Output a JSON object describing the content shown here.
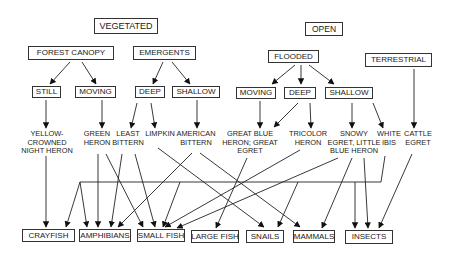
{
  "diagram": {
    "habitats": {
      "vegetated": "VEGETATED",
      "open": "OPEN",
      "forest_canopy": "FOREST CANOPY",
      "emergents": "EMERGENTS",
      "flooded": "FLOODED",
      "terrestrial": "TERRESTRIAL",
      "veg_still": "STILL",
      "veg_moving": "MOVING",
      "veg_deep": "DEEP",
      "veg_shallow": "SHALLOW",
      "open_moving": "MOVING",
      "open_deep": "DEEP",
      "open_shallow": "SHALLOW"
    },
    "birds": {
      "yellow_crowned_night_heron": "YELLOW-\nCROWNED\nNIGHT HERON",
      "green_heron": "GREEN\nHERON",
      "least_bittern": "LEAST\nBITTERN",
      "limpkin": "LIMPKIN",
      "american_bittern": "AMERICAN\nBITTERN",
      "great_blue_heron_great_egret": "GREAT BLUE\nHERON; GREAT\nEGRET",
      "tricolor_heron": "TRICOLOR\nHERON",
      "snowy_egret_little_blue_heron": "SNOWY\nEGRET, LITTLE\nBLUE HERON",
      "white_ibis": "WHITE\nIBIS",
      "cattle_egret": "CATTLE\nEGRET"
    },
    "prey": {
      "crayfish": "CRAYFISH",
      "amphibians": "AMPHIBIANS",
      "small_fish": "SMALL FISH",
      "large_fish": "LARGE FISH",
      "snails": "SNAILS",
      "mammals": "MAMMALS",
      "insects": "INSECTS"
    },
    "edges": [
      [
        "vegetated-habitat",
        "forest-canopy"
      ],
      [
        "vegetated-habitat",
        "emergents"
      ],
      [
        "forest-canopy",
        "veg-still"
      ],
      [
        "forest-canopy",
        "veg-moving"
      ],
      [
        "emergents",
        "veg-deep"
      ],
      [
        "emergents",
        "veg-shallow"
      ],
      [
        "open-habitat",
        "flooded"
      ],
      [
        "open-habitat",
        "terrestrial"
      ],
      [
        "flooded",
        "open-moving"
      ],
      [
        "flooded",
        "open-deep"
      ],
      [
        "flooded",
        "open-shallow"
      ],
      [
        "veg-still",
        "yellow-crowned-night-heron"
      ],
      [
        "veg-moving",
        "green-heron"
      ],
      [
        "veg-deep",
        "least-bittern"
      ],
      [
        "veg-deep",
        "limpkin"
      ],
      [
        "veg-shallow",
        "american-bittern"
      ],
      [
        "open-moving",
        "great-blue-heron-great-egret"
      ],
      [
        "open-deep",
        "great-blue-heron-great-egret"
      ],
      [
        "open-deep",
        "tricolor-heron"
      ],
      [
        "open-shallow",
        "snowy-egret-little-blue-heron"
      ],
      [
        "open-shallow",
        "white-ibis"
      ],
      [
        "terrestrial",
        "cattle-egret"
      ],
      [
        "yellow-crowned-night-heron",
        "crayfish"
      ],
      [
        "green-heron",
        "amphibians"
      ],
      [
        "green-heron",
        "small-fish"
      ],
      [
        "least-bittern",
        "amphibians"
      ],
      [
        "least-bittern",
        "small-fish"
      ],
      [
        "limpkin",
        "snails"
      ],
      [
        "american-bittern",
        "amphibians"
      ],
      [
        "american-bittern",
        "mammals"
      ],
      [
        "great-blue-heron-great-egret",
        "large-fish"
      ],
      [
        "tricolor-heron",
        "small-fish"
      ],
      [
        "snowy-egret-little-blue-heron",
        "small-fish"
      ],
      [
        "snowy-egret-little-blue-heron",
        "mammals"
      ],
      [
        "snowy-egret-little-blue-heron",
        "insects"
      ],
      [
        "white-ibis",
        "crayfish"
      ],
      [
        "white-ibis",
        "amphibians"
      ],
      [
        "white-ibis",
        "small-fish"
      ],
      [
        "white-ibis",
        "snails"
      ],
      [
        "white-ibis",
        "insects"
      ],
      [
        "cattle-egret",
        "insects"
      ]
    ]
  }
}
